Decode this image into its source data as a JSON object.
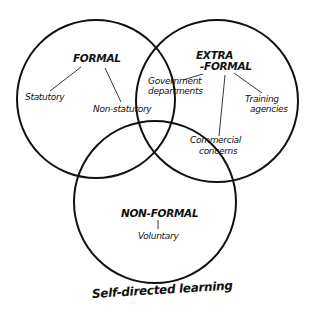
{
  "diagram": {
    "type": "venn",
    "caption": "Self-directed learning",
    "circles": [
      {
        "id": "formal",
        "heading": "FORMAL",
        "items": [
          "Statutory",
          "Non-statutory"
        ]
      },
      {
        "id": "extra-formal",
        "heading_line1": "EXTRA",
        "heading_line2": "-FORMAL",
        "items": [
          "Government departments",
          "Training agencies",
          "Commercial concerns"
        ]
      },
      {
        "id": "non-formal",
        "heading": "NON-FORMAL",
        "items": [
          "Voluntary"
        ]
      }
    ],
    "labels": {
      "formal": "FORMAL",
      "statutory": "Statutory",
      "non_statutory": "Non-statutory",
      "extra": "EXTRA",
      "formal_extra": "-FORMAL",
      "government": "Government",
      "departments": "departments",
      "training": "Training",
      "agencies": "agencies",
      "commercial": "Commercial",
      "concerns": "concerns",
      "non_formal": "NON-FORMAL",
      "voluntary": "Voluntary"
    },
    "colors": {
      "stroke": "#111111",
      "background": "#ffffff"
    }
  }
}
